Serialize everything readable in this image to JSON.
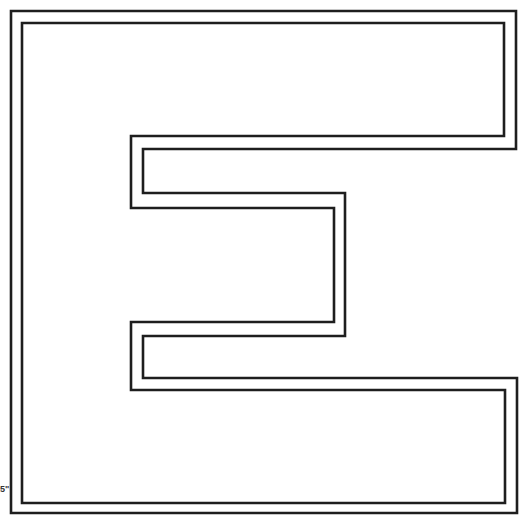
{
  "artwork": {
    "subject": "Letter E outline coloring page",
    "letter": "E",
    "style": "double-line outline",
    "line_color": "#1e1e1e",
    "background_color": "#ffffff"
  },
  "edge_mark": {
    "text": "5\""
  }
}
